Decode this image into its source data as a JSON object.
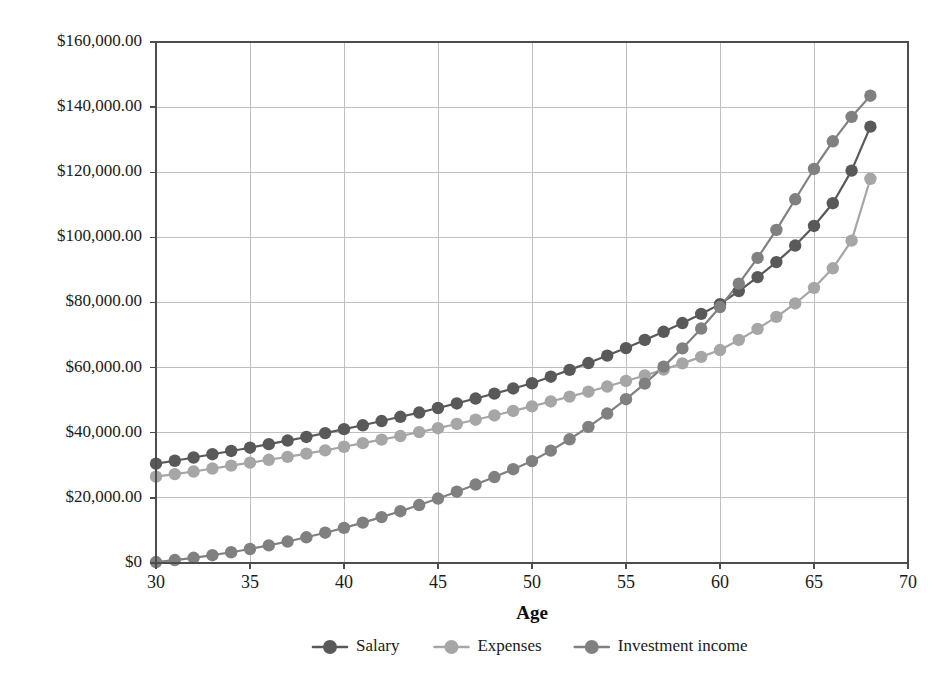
{
  "chart_data": {
    "type": "line",
    "title": "",
    "xlabel": "Age",
    "ylabel": "",
    "xlim": [
      30,
      70
    ],
    "ylim": [
      0,
      160000
    ],
    "xticks": [
      30,
      35,
      40,
      45,
      50,
      55,
      60,
      65,
      70
    ],
    "xtick_labels": [
      "30",
      "35",
      "40",
      "45",
      "50",
      "55",
      "60",
      "65",
      "70"
    ],
    "yticks": [
      0,
      20000,
      40000,
      60000,
      80000,
      100000,
      120000,
      140000,
      160000
    ],
    "ytick_labels": [
      "$0",
      "$20,000.00",
      "$40,000.00",
      "$60,000.00",
      "$80,000.00",
      "$100,000.00",
      "$120,000.00",
      "$140,000.00",
      "$160,000.00"
    ],
    "grid": true,
    "grid_axis": "both",
    "legend_position": "bottom",
    "markers": true,
    "marker_shape": "circle",
    "x": [
      30,
      31,
      32,
      33,
      34,
      35,
      36,
      37,
      38,
      39,
      40,
      41,
      42,
      43,
      44,
      45,
      46,
      47,
      48,
      49,
      50,
      51,
      52,
      53,
      54,
      55,
      56,
      57,
      58,
      59,
      60,
      61,
      62,
      63,
      64,
      65,
      66,
      67,
      68
    ],
    "series": [
      {
        "name": "Salary",
        "color": "#595959",
        "values": [
          30500,
          31400,
          32400,
          33400,
          34400,
          35400,
          36500,
          37600,
          38700,
          39900,
          41100,
          42300,
          43600,
          44900,
          46200,
          47600,
          49000,
          50500,
          52000,
          53600,
          55200,
          57200,
          59300,
          61400,
          63700,
          66000,
          68500,
          71000,
          73700,
          76500,
          79500,
          83500,
          87800,
          92400,
          97500,
          103500,
          110500,
          120500,
          134000
        ]
      },
      {
        "name": "Expenses",
        "color": "#a6a6a6",
        "values": [
          26500,
          27300,
          28100,
          29000,
          29900,
          30800,
          31700,
          32600,
          33600,
          34600,
          35700,
          36800,
          37900,
          39000,
          40200,
          41400,
          42700,
          44000,
          45300,
          46700,
          48100,
          49600,
          51100,
          52600,
          54200,
          55900,
          57600,
          59400,
          61300,
          63300,
          65400,
          68500,
          71900,
          75600,
          79700,
          84500,
          90500,
          99000,
          118000
        ]
      },
      {
        "name": "Investment income",
        "color": "#808080",
        "values": [
          300,
          900,
          1600,
          2400,
          3300,
          4300,
          5400,
          6600,
          7900,
          9300,
          10800,
          12400,
          14100,
          15900,
          17800,
          19800,
          21900,
          24100,
          26400,
          28800,
          31300,
          34500,
          38000,
          41800,
          45900,
          50300,
          55100,
          60300,
          65900,
          72000,
          78600,
          85800,
          93700,
          102300,
          111700,
          121000,
          129500,
          137000,
          143500
        ]
      }
    ]
  },
  "legend": {
    "items": [
      {
        "label": "Salary",
        "color": "#595959"
      },
      {
        "label": "Expenses",
        "color": "#a6a6a6"
      },
      {
        "label": "Investment income",
        "color": "#808080"
      }
    ]
  },
  "axes": {
    "x_title": "Age"
  }
}
